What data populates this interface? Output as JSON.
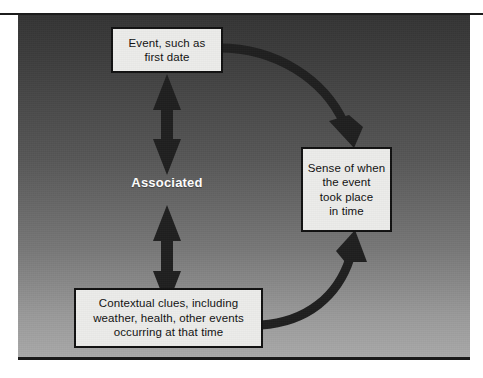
{
  "figure": {
    "type": "concept-diagram",
    "background_gradient_top": "#343434",
    "background_gradient_bottom": "#a9a9a9",
    "box_fill": "#ececea",
    "box_border": "#111111",
    "arrow_color": "#1a1a1a",
    "label_color": "#ffffff"
  },
  "nodes": [
    {
      "id": "event",
      "text": "Event, such as\nfirst date",
      "lines": [
        "Event, such as",
        "first date"
      ]
    },
    {
      "id": "sense",
      "text": "Sense of when\nthe event\ntook place\nin time",
      "lines": [
        "Sense of when",
        "the event",
        "took place",
        "in time"
      ]
    },
    {
      "id": "context",
      "text": "Contextual clues, including\nweather, health, other events\noccurring at that time",
      "lines": [
        "Contextual clues, including",
        "weather, health, other events",
        "occurring at that time"
      ]
    }
  ],
  "labels": {
    "associated": "Associated"
  },
  "connectors": [
    {
      "id": "event-to-associated",
      "style": "double-headed-straight",
      "orientation": "vertical",
      "from": "event",
      "to": "associated"
    },
    {
      "id": "associated-to-context",
      "style": "double-headed-straight",
      "orientation": "vertical",
      "from": "associated",
      "to": "context"
    },
    {
      "id": "event-to-sense",
      "style": "curved-single-headed",
      "from": "event",
      "to": "sense"
    },
    {
      "id": "context-to-sense",
      "style": "curved-single-headed",
      "from": "context",
      "to": "sense"
    }
  ]
}
